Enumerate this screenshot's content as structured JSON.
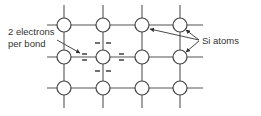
{
  "diagram": {
    "labels": {
      "electrons_line1": "2 electrons",
      "electrons_line2": "per bond",
      "atoms": "Si atoms"
    },
    "grid": {
      "columns_x": [
        64,
        103,
        142,
        180
      ],
      "rows_y": [
        25,
        57,
        88
      ],
      "atom_radius": 7,
      "h_line_extent": [
        47,
        203
      ],
      "v_line_extent": [
        5,
        108
      ]
    },
    "highlighted_atom": {
      "col": 1,
      "row": 1
    },
    "colors": {
      "line": "#555555",
      "atom_stroke": "#444444",
      "text": "#333333",
      "background": "#ffffff"
    }
  }
}
